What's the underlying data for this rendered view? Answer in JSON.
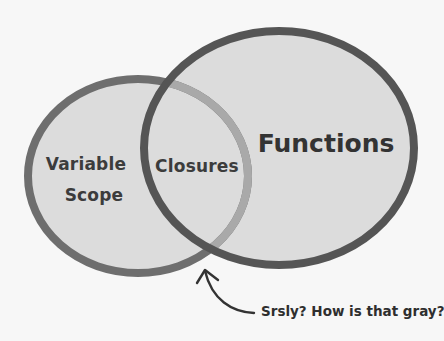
{
  "diagram": {
    "type": "venn",
    "sets": [
      {
        "id": "variable-scope",
        "label_lines": [
          "Variable",
          "Scope"
        ]
      },
      {
        "id": "functions",
        "label_lines": [
          "Functions"
        ]
      }
    ],
    "intersection": {
      "label": "Closures",
      "between": [
        "variable-scope",
        "functions"
      ]
    },
    "annotation": {
      "text": "Srsly? How is that gray?",
      "points_to": "intersection"
    },
    "colors": {
      "background": "#f7f7f7",
      "fill": "#dcdcdc",
      "left_stroke": "#6e6e6e",
      "left_stroke_inside": "#a9a9a9",
      "right_stroke": "#555555",
      "text": "#3c3c3c",
      "arrow": "#333333"
    }
  }
}
